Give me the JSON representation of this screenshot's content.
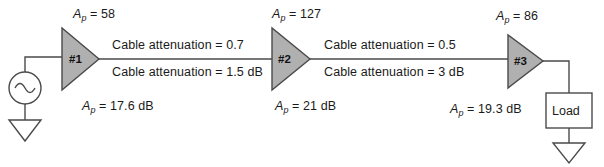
{
  "diagram": {
    "type": "block-schematic",
    "colors": {
      "line": "#4a4a4a",
      "amplifier_fill": "#b0b0b0",
      "amplifier_stroke": "#4a4a4a",
      "text": "#1a1a1a",
      "background": "#ffffff"
    },
    "source": {
      "symbol": "ac-source",
      "glyph": "~"
    },
    "stages": [
      {
        "tag": "#1",
        "gain_ratio": "Aₚ = 58",
        "gain_ratio_value": "58",
        "gain_db": "Aₚ = 17.6 dB",
        "gain_db_value": "17.6 dB"
      },
      {
        "tag": "#2",
        "gain_ratio": "Aₚ = 127",
        "gain_ratio_value": "127",
        "gain_db": "Aₚ = 21 dB",
        "gain_db_value": "21 dB"
      },
      {
        "tag": "#3",
        "gain_ratio": "Aₚ = 86",
        "gain_ratio_value": "86",
        "gain_db": "Aₚ = 19.3 dB",
        "gain_db_value": "19.3 dB"
      }
    ],
    "cables": [
      {
        "ratio_label": "Cable attenuation = 0.7",
        "db_label": "Cable attenuation = 1.5 dB"
      },
      {
        "ratio_label": "Cable attenuation = 0.5",
        "db_label": "Cable attenuation = 3 dB"
      }
    ],
    "load": {
      "label": "Load"
    },
    "grounds": [
      {
        "name": "source-ground"
      },
      {
        "name": "load-ground"
      }
    ]
  }
}
